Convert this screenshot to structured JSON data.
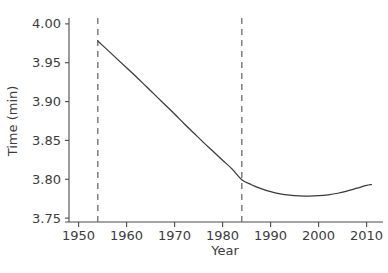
{
  "chart_data": {
    "type": "line",
    "title": "",
    "xlabel": "Year",
    "ylabel": "Time (min)",
    "xlim": [
      1948,
      2013
    ],
    "ylim": [
      3.745,
      4.005
    ],
    "grid": false,
    "legend": "none",
    "xticks": [
      1950,
      1960,
      1970,
      1980,
      1990,
      2000,
      2010
    ],
    "xtick_labels": [
      "1950",
      "1960",
      "1970",
      "1980",
      "1990",
      "2000",
      "2010"
    ],
    "yticks": [
      3.75,
      3.8,
      3.85,
      3.9,
      3.95,
      4.0
    ],
    "ytick_labels": [
      "3.75",
      "3.80",
      "3.85",
      "3.90",
      "3.95",
      "4.00"
    ],
    "line_color": "#3a3a3a",
    "annotation_color": "#6b6b6b",
    "series": [
      {
        "name": "fitted-time-trend",
        "style": "solid",
        "x": [
          1954,
          1956,
          1958,
          1960,
          1962,
          1964,
          1966,
          1968,
          1970,
          1972,
          1974,
          1976,
          1978,
          1980,
          1982,
          1984,
          1986,
          1988,
          1990,
          1992,
          1994,
          1996,
          1998,
          2000,
          2002,
          2004,
          2006,
          2008,
          2010,
          2011
        ],
        "y": [
          3.978,
          3.9665,
          3.955,
          3.9435,
          3.932,
          3.92,
          3.908,
          3.896,
          3.884,
          3.8715,
          3.8595,
          3.8475,
          3.836,
          3.8245,
          3.813,
          3.7995,
          3.793,
          3.788,
          3.784,
          3.7812,
          3.7795,
          3.7786,
          3.7783,
          3.7788,
          3.78,
          3.782,
          3.785,
          3.7885,
          3.792,
          3.7932
        ]
      }
    ],
    "vertical_lines": [
      {
        "name": "breakpoint-1954",
        "x": 1954,
        "style": "dashed"
      },
      {
        "name": "breakpoint-1984",
        "x": 1984,
        "style": "dashed"
      }
    ]
  }
}
